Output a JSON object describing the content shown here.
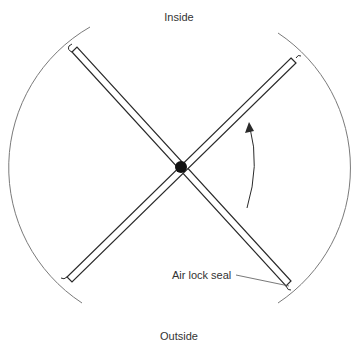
{
  "diagram": {
    "title_top": "Inside",
    "title_bottom": "Outside",
    "callout": "Air lock seal",
    "elements": {
      "housing": "circular enclosure (two arcs, left and right)",
      "doors": "four-wing revolving door panels crossing at central pivot",
      "pivot": "central hub",
      "rotation_arrow": "counter-clockwise rotation indicator"
    },
    "colors": {
      "line": "#2a2a2a",
      "arc": "#7a7a7a",
      "text": "#333333"
    }
  }
}
